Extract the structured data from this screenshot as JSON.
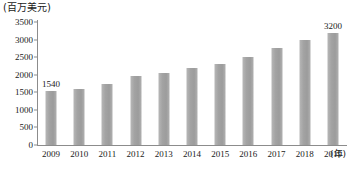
{
  "chart_data": {
    "type": "bar",
    "title": "",
    "subtitle": "",
    "unit_caption": "(百万美元)",
    "xlabel": "(年)",
    "ylabel": "",
    "categories": [
      "2009",
      "2010",
      "2011",
      "2012",
      "2013",
      "2014",
      "2015",
      "2016",
      "2017",
      "2018",
      "2019"
    ],
    "values": [
      1540,
      1600,
      1750,
      1950,
      2050,
      2200,
      2300,
      2500,
      2750,
      3000,
      3200
    ],
    "point_labels": [
      "1540",
      "",
      "",
      "",
      "",
      "",
      "",
      "",
      "",
      "",
      "3200"
    ],
    "ylim": [
      0,
      3500
    ],
    "yticks": [
      0,
      500,
      1000,
      1500,
      2000,
      2500,
      3000,
      3500
    ],
    "ytick_labels": [
      "0",
      "500",
      "1000",
      "1500",
      "2000",
      "2500",
      "3000",
      "3500"
    ],
    "grid": false,
    "legend": null,
    "legend_position": "none",
    "series": [
      {
        "name": "",
        "values": [
          1540,
          1600,
          1750,
          1950,
          2050,
          2200,
          2300,
          2500,
          2750,
          3000,
          3200
        ]
      }
    ],
    "colors": {
      "bar": "#a6a6a6",
      "axis": "#8c8c8c",
      "text": "#1a1a1a",
      "background": "#ffffff"
    }
  }
}
